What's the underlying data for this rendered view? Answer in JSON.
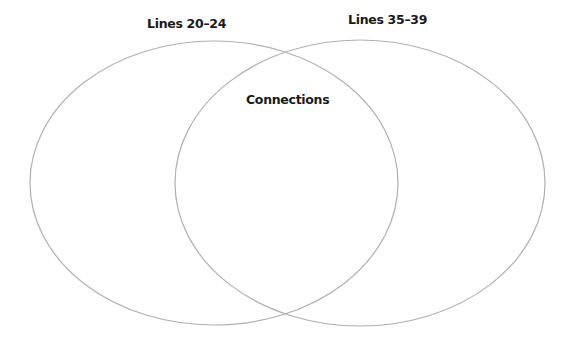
{
  "diagram": {
    "type": "venn",
    "sets": [
      {
        "id": "left",
        "label": "Lines 20–24",
        "cx": 214,
        "cy": 183,
        "rx": 184,
        "ry": 142
      },
      {
        "id": "right",
        "label": "Lines 35–39",
        "cx": 360,
        "cy": 183,
        "rx": 185,
        "ry": 143
      }
    ],
    "intersection": {
      "label": "Connections"
    },
    "stroke_color": "#b0b0b0",
    "text_color": "#1a1a1a",
    "background": "#ffffff"
  }
}
